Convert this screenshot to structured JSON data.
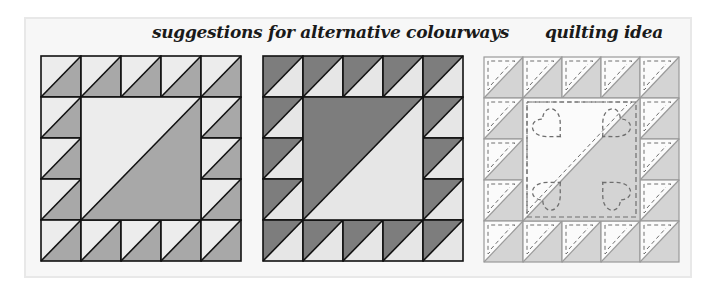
{
  "headings": {
    "alternatives": "suggestions for alternative colourways",
    "quilting": "quilting idea"
  },
  "blocks": [
    {
      "id": "colourway-1",
      "grid": 5,
      "light_color": "#ececec",
      "dark_color": "#a8a8a8",
      "light_side": "upper-left",
      "stroke": "#111111",
      "quilting": false
    },
    {
      "id": "colourway-2",
      "grid": 5,
      "light_color": "#e6e6e6",
      "dark_color": "#7d7d7d",
      "light_side": "lower-right",
      "stroke": "#111111",
      "quilting": false
    },
    {
      "id": "quilting-idea",
      "grid": 5,
      "light_color": "#fbfbfb",
      "dark_color": "#d4d4d4",
      "light_side": "upper-left",
      "stroke": "#9a9a9a",
      "quilting": true,
      "quilting_color": "#6e6e6e",
      "motif": "heart",
      "motif_count": 4
    }
  ]
}
